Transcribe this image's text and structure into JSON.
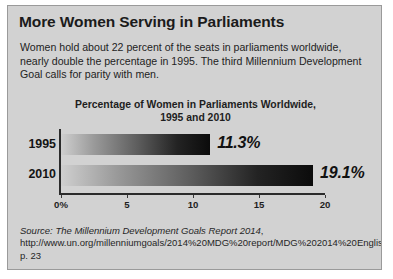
{
  "headline": "More Women Serving in Parliaments",
  "intro": "Women hold about 22 percent of the seats in parliaments worldwide, nearly double the percentage in 1995. The third Millennium Development Goal calls for parity with men.",
  "chart_data": {
    "type": "bar",
    "orientation": "horizontal",
    "title": "Percentage of Women in Parliaments Worldwide, 1995 and 2010",
    "title_line1": "Percentage of Women in Parliaments Worldwide,",
    "title_line2": "1995 and 2010",
    "categories": [
      "1995",
      "2010"
    ],
    "values": [
      11.3,
      19.1
    ],
    "value_labels": [
      "11.3%",
      "19.1%"
    ],
    "xlabel": "",
    "ylabel": "",
    "xlim": [
      0,
      20
    ],
    "tick_values": [
      0,
      5,
      10,
      15,
      20
    ],
    "tick_labels": [
      "0%",
      "5",
      "10",
      "15",
      "20"
    ],
    "grid": false,
    "legend": false,
    "bar_gradient_from": "#cfcfcf",
    "bar_gradient_to": "#0b0b0b"
  },
  "source": {
    "prefix": "Source:",
    "title": "The Millennium Development Goals Report 2014",
    "rest": ", http://www.un.org/millenniumgoals/2014%20MDG%20report/MDG%202014%20English%20web.pdf, p. 23"
  },
  "colors": {
    "panel_background": "#d2d2d2",
    "panel_border": "#9a9a9a",
    "text": "#1b1b1b",
    "axis": "#2b2b2b"
  }
}
